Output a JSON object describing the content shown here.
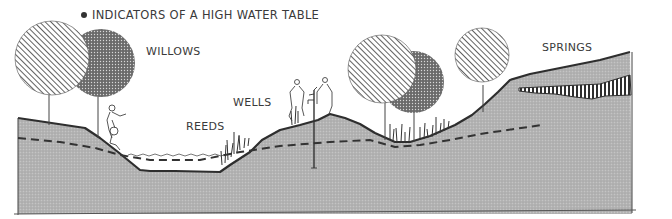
{
  "diagram": {
    "title": "INDICATORS OF A HIGH WATER TABLE",
    "title_bullet_icon": "filled-circle",
    "labels": {
      "willows": "WILLOWS",
      "reeds": "REEDS",
      "wells": "WELLS",
      "springs": "SPRINGS"
    },
    "colors": {
      "ground_fill": "#b9b9b9",
      "outline": "#2e2e2e",
      "dashed_water_table": "#333333",
      "text": "#3a3a3a",
      "background": "#ffffff"
    },
    "elements": [
      "ground-cross-section",
      "water-table-dashed-line",
      "pond-water-surface",
      "willow-trees-hatched",
      "willow-trees-stippled",
      "reeds",
      "well-with-pump",
      "human-figures",
      "spring-seep-layer"
    ]
  }
}
